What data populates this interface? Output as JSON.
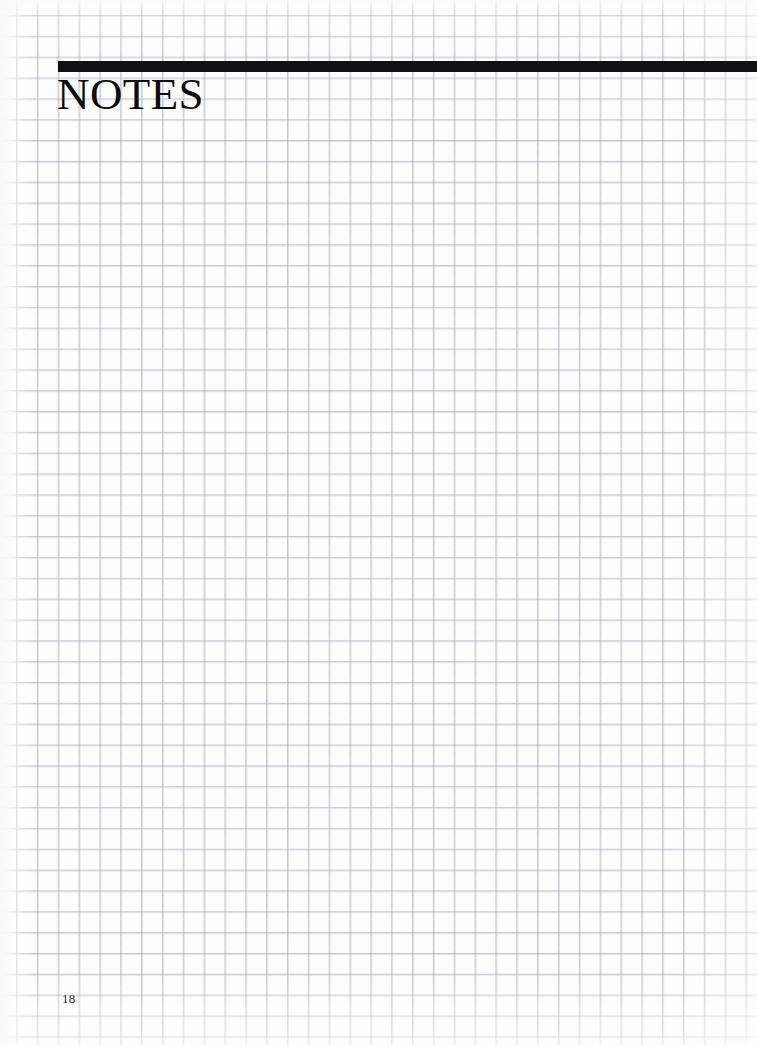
{
  "document": {
    "kind": "notes-page",
    "title": "NOTES",
    "page_number": "18",
    "paper": {
      "type": "graph-paper",
      "grid_cell_px": 21,
      "grid_color": "#969ea8",
      "background_color": "#fdfdfd"
    },
    "rule": {
      "color": "#111113",
      "thickness_px": 11
    },
    "notes_area": {
      "content": "",
      "placeholder": ""
    }
  }
}
